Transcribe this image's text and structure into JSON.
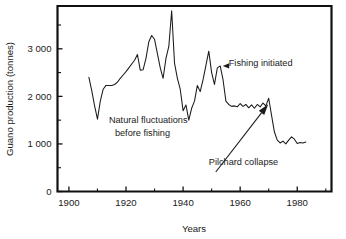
{
  "chart_data": {
    "type": "line",
    "title": "",
    "xlabel": "Years",
    "ylabel": "Guano production (tonnes)",
    "xlim": [
      1896,
      1992
    ],
    "ylim": [
      0,
      3900
    ],
    "grid": false,
    "legend": "none",
    "x_ticks_major": [
      1900,
      1920,
      1940,
      1960,
      1980
    ],
    "x_ticks_major_labels": [
      "1900",
      "1920",
      "1940",
      "1960",
      "1980"
    ],
    "x_ticks_minor": [
      1910,
      1930,
      1950,
      1970,
      1990
    ],
    "y_ticks_major": [
      0,
      1000,
      2000,
      3000
    ],
    "y_ticks_major_labels": [
      "0",
      "1 000",
      "2 000",
      "3 000"
    ],
    "y_ticks_minor": [
      500,
      1500,
      2500,
      3500
    ],
    "series": [
      {
        "name": "Guano production",
        "color": "#1b1b1b",
        "x": [
          1907,
          1908,
          1909,
          1910,
          1911,
          1912,
          1913,
          1914,
          1915,
          1916,
          1917,
          1918,
          1919,
          1920,
          1921,
          1922,
          1923,
          1924,
          1925,
          1926,
          1927,
          1928,
          1929,
          1930,
          1931,
          1932,
          1933,
          1934,
          1935,
          1936,
          1937,
          1938,
          1939,
          1940,
          1941,
          1942,
          1943,
          1944,
          1945,
          1946,
          1947,
          1948,
          1949,
          1950,
          1951,
          1952,
          1953,
          1954,
          1955,
          1956,
          1957,
          1958,
          1959,
          1960,
          1961,
          1962,
          1963,
          1964,
          1965,
          1966,
          1967,
          1968,
          1969,
          1970,
          1971,
          1972,
          1973,
          1974,
          1975,
          1976,
          1977,
          1978,
          1979,
          1980,
          1981,
          1982,
          1983
        ],
        "y": [
          2400,
          2120,
          1800,
          1520,
          1900,
          2150,
          2230,
          2230,
          2230,
          2250,
          2300,
          2380,
          2450,
          2520,
          2600,
          2680,
          2760,
          2880,
          2550,
          2560,
          2800,
          3150,
          3280,
          3200,
          2900,
          2600,
          2380,
          2800,
          3050,
          3800,
          2700,
          2380,
          2150,
          1700,
          1820,
          1500,
          1750,
          1900,
          2230,
          2100,
          2350,
          2650,
          2950,
          2500,
          2250,
          2600,
          2640,
          2350,
          1900,
          1830,
          1790,
          1800,
          1780,
          1850,
          1790,
          1830,
          1760,
          1820,
          1750,
          1830,
          1780,
          1860,
          1800,
          1960,
          1600,
          1250,
          1080,
          1020,
          1060,
          1000,
          1080,
          1150,
          1100,
          1010,
          1030,
          1020,
          1040
        ]
      }
    ],
    "annotations": [
      {
        "id": "fishing-initiated",
        "text": "Fishing initiated",
        "text_x": 1956,
        "text_y": 2700,
        "target_x": 1953,
        "target_y": 2640,
        "arrow": "left"
      },
      {
        "id": "natural-fluctuations",
        "text_line1": "Natural fluctuations",
        "text_line2": "before fishing",
        "text_x": 1914,
        "text_y": 1430,
        "arrow": "none"
      },
      {
        "id": "pilchard-collapse",
        "text": "Pilchard collapse",
        "text_x": 1949,
        "text_y": 620,
        "target_x": 1970,
        "target_y": 1900,
        "arrow": "up-right"
      }
    ]
  }
}
